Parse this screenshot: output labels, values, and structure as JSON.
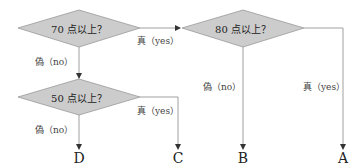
{
  "colors": {
    "diamond_fill": "#cccccc",
    "diamond_stroke": "#999999",
    "line": "#888888",
    "text": "#222222"
  },
  "nodes": {
    "q70": {
      "label": "70 点以上？"
    },
    "q80": {
      "label": "80 点以上？"
    },
    "q50": {
      "label": "50 点以上？"
    }
  },
  "edges": {
    "q70_yes": "真（yes）",
    "q70_no": "偽（no）",
    "q80_no": "偽（no）",
    "q80_yes": "真（yes）",
    "q50_yes": "真（yes）",
    "q50_no": "偽（no）"
  },
  "outcomes": {
    "D": "D",
    "C": "C",
    "B": "B",
    "A": "A"
  }
}
